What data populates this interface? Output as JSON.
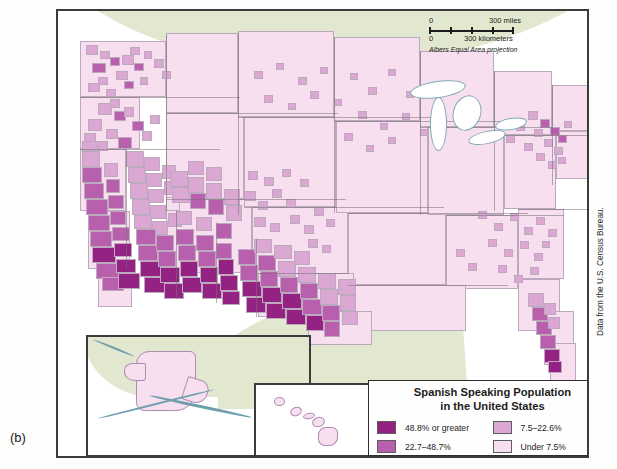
{
  "figure": {
    "panel_label": "(b)",
    "credit": "Data from the U.S. Census Bureau."
  },
  "scale": {
    "miles_zero": "0",
    "miles_max": "300 miles",
    "km_zero": "0",
    "km_max": "300 kilometers",
    "projection": "Albers Equal Area projection"
  },
  "legend": {
    "title_line1": "Spanish Speaking Population",
    "title_line2": "in the United States",
    "classes": [
      {
        "label": "48.8% or greater",
        "color": "#932283"
      },
      {
        "label": "22.7–48.7%",
        "color": "#b860ad"
      },
      {
        "label": "7.5–22.6%",
        "color": "#dba8d4"
      },
      {
        "label": "Under 7.5%",
        "color": "#f7dff0"
      }
    ]
  },
  "chart_data": {
    "type": "heatmap",
    "title": "Spanish Speaking Population in the United States",
    "subtitle": "",
    "xlabel": "",
    "ylabel": "",
    "projection": "Albers Equal Area projection",
    "unit": "percent of population speaking Spanish",
    "legend_position": "bottom-right",
    "grid": false,
    "classes": [
      {
        "index": 3,
        "label": "48.8% or greater",
        "min": 48.8,
        "max": 100.0,
        "color": "#932283"
      },
      {
        "index": 2,
        "label": "22.7–48.7%",
        "min": 22.7,
        "max": 48.7,
        "color": "#b860ad"
      },
      {
        "index": 1,
        "label": "7.5–22.6%",
        "min": 7.5,
        "max": 22.6,
        "color": "#dba8d4"
      },
      {
        "index": 0,
        "label": "Under 7.5%",
        "min": 0.0,
        "max": 7.5,
        "color": "#f7dff0"
      }
    ],
    "insets": [
      {
        "name": "Alaska",
        "class_index": 0,
        "label": "Under 7.5%"
      },
      {
        "name": "Hawaii",
        "class_index": 0,
        "label": "Under 7.5%"
      }
    ],
    "regions": [
      {
        "name": "South Texas / Rio Grande Valley",
        "class_index": 3,
        "label": "48.8% or greater"
      },
      {
        "name": "West Texas border counties",
        "class_index": 3,
        "label": "48.8% or greater"
      },
      {
        "name": "Southern New Mexico",
        "class_index": 3,
        "label": "48.8% or greater"
      },
      {
        "name": "Southern Arizona border",
        "class_index": 3,
        "label": "48.8% or greater"
      },
      {
        "name": "Imperial Valley, California",
        "class_index": 3,
        "label": "48.8% or greater"
      },
      {
        "name": "Miami-Dade, Florida",
        "class_index": 3,
        "label": "48.8% or greater"
      },
      {
        "name": "Central / Southern California",
        "class_index": 2,
        "label": "22.7–48.7%"
      },
      {
        "name": "Northern New Mexico",
        "class_index": 2,
        "label": "22.7–48.7%"
      },
      {
        "name": "Central Texas",
        "class_index": 2,
        "label": "22.7–48.7%"
      },
      {
        "name": "Southern Florida",
        "class_index": 2,
        "label": "22.7–48.7%"
      },
      {
        "name": "Eastern Washington / Yakima",
        "class_index": 2,
        "label": "22.7–48.7%"
      },
      {
        "name": "Southern Colorado",
        "class_index": 2,
        "label": "22.7–48.7%"
      },
      {
        "name": "Northern California",
        "class_index": 1,
        "label": "7.5–22.6%"
      },
      {
        "name": "Nevada / Utah urban counties",
        "class_index": 1,
        "label": "7.5–22.6%"
      },
      {
        "name": "Western Kansas / Nebraska",
        "class_index": 1,
        "label": "7.5–22.6%"
      },
      {
        "name": "Idaho / Oregon scattered",
        "class_index": 1,
        "label": "7.5–22.6%"
      },
      {
        "name": "New York / New Jersey metro",
        "class_index": 1,
        "label": "7.5–22.6%"
      },
      {
        "name": "Coastal Carolinas / Georgia",
        "class_index": 1,
        "label": "7.5–22.6%"
      },
      {
        "name": "Upper Midwest",
        "class_index": 0,
        "label": "Under 7.5%"
      },
      {
        "name": "Great Plains (Dakotas, Montana)",
        "class_index": 0,
        "label": "Under 7.5%"
      },
      {
        "name": "Appalachia / Ohio Valley",
        "class_index": 0,
        "label": "Under 7.5%"
      },
      {
        "name": "Deep South (Alabama, Mississippi)",
        "class_index": 0,
        "label": "Under 7.5%"
      },
      {
        "name": "New England",
        "class_index": 0,
        "label": "Under 7.5%"
      }
    ]
  }
}
